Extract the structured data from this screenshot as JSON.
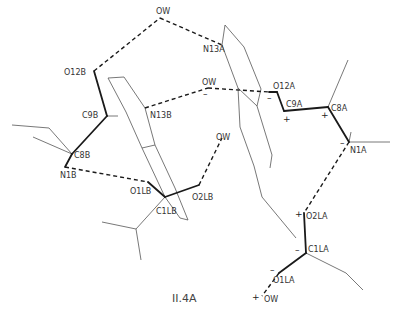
{
  "figure": {
    "caption": "II.4A",
    "colors": {
      "line": "#1a1a1a",
      "thin_line": "#555555",
      "label": "#333333",
      "background": "#ffffff"
    }
  },
  "atoms": [
    {
      "id": "OW_top",
      "label": "OW",
      "x": 160,
      "y": 18,
      "lx": 156,
      "ly": 14
    },
    {
      "id": "N13A",
      "label": "N13A",
      "x": 222,
      "y": 45,
      "lx": 203,
      "ly": 52
    },
    {
      "id": "O12B",
      "label": "O12B",
      "x": 94,
      "y": 71,
      "lx": 64,
      "ly": 75
    },
    {
      "id": "OW_mid",
      "label": "OW",
      "x": 208,
      "y": 88,
      "lx": 202,
      "ly": 85
    },
    {
      "id": "O12A",
      "label": "O12A",
      "x": 277,
      "y": 92,
      "lx": 273,
      "ly": 89
    },
    {
      "id": "C9A",
      "label": "C9A",
      "x": 284,
      "y": 111,
      "lx": 286,
      "ly": 107
    },
    {
      "id": "C8A",
      "label": "C8A",
      "x": 328,
      "y": 107,
      "lx": 331,
      "ly": 111
    },
    {
      "id": "C9B",
      "label": "C9B",
      "x": 107,
      "y": 116,
      "lx": 82,
      "ly": 118
    },
    {
      "id": "N13B",
      "label": "N13B",
      "x": 145,
      "y": 108,
      "lx": 150,
      "ly": 118
    },
    {
      "id": "N1A",
      "label": "N1A",
      "x": 349,
      "y": 142,
      "lx": 350,
      "ly": 153
    },
    {
      "id": "OW_right",
      "label": "OW",
      "x": 222,
      "y": 138,
      "lx": 216,
      "ly": 140
    },
    {
      "id": "C8B",
      "label": "C8B",
      "x": 72,
      "y": 154,
      "lx": 74,
      "ly": 158
    },
    {
      "id": "N1B",
      "label": "N1B",
      "x": 65,
      "y": 167,
      "lx": 60,
      "ly": 178
    },
    {
      "id": "O1LB",
      "label": "O1LB",
      "x": 148,
      "y": 182,
      "lx": 130,
      "ly": 194
    },
    {
      "id": "O2LB",
      "label": "O2LB",
      "x": 199,
      "y": 185,
      "lx": 192,
      "ly": 200
    },
    {
      "id": "C1LB",
      "label": "C1LB",
      "x": 165,
      "y": 197,
      "lx": 156,
      "ly": 214
    },
    {
      "id": "O2LA",
      "label": "O2LA",
      "x": 304,
      "y": 213,
      "lx": 306,
      "ly": 219
    },
    {
      "id": "C1LA",
      "label": "C1LA",
      "x": 306,
      "y": 253,
      "lx": 308,
      "ly": 252
    },
    {
      "id": "O1LA",
      "label": "O1LA",
      "x": 279,
      "y": 273,
      "lx": 273,
      "ly": 283
    },
    {
      "id": "OW_bot",
      "label": "OW",
      "x": 262,
      "y": 296,
      "lx": 264,
      "ly": 302
    }
  ],
  "charges": [
    {
      "sign": "–",
      "x": 267,
      "y": 101
    },
    {
      "sign": "+",
      "x": 283,
      "y": 122
    },
    {
      "sign": "+",
      "x": 321,
      "y": 118
    },
    {
      "sign": "–",
      "x": 340,
      "y": 146
    },
    {
      "sign": "–",
      "x": 203,
      "y": 97
    },
    {
      "sign": "+",
      "x": 295,
      "y": 217
    },
    {
      "sign": "–",
      "x": 295,
      "y": 253
    },
    {
      "sign": "–",
      "x": 270,
      "y": 273
    },
    {
      "sign": "+",
      "x": 252,
      "y": 300
    }
  ],
  "bonds_bold": [
    [
      94,
      71,
      107,
      116
    ],
    [
      107,
      116,
      72,
      154
    ],
    [
      72,
      154,
      65,
      167
    ],
    [
      284,
      111,
      328,
      107
    ],
    [
      328,
      107,
      349,
      142
    ],
    [
      284,
      111,
      277,
      92
    ],
    [
      277,
      92,
      269,
      92
    ],
    [
      148,
      182,
      165,
      197
    ],
    [
      165,
      197,
      199,
      185
    ],
    [
      304,
      213,
      306,
      253
    ],
    [
      306,
      253,
      279,
      273
    ]
  ],
  "hydrogen_bonds": [
    [
      94,
      71,
      160,
      18
    ],
    [
      160,
      18,
      222,
      45
    ],
    [
      145,
      108,
      208,
      88
    ],
    [
      208,
      88,
      269,
      92
    ],
    [
      65,
      167,
      148,
      182
    ],
    [
      199,
      185,
      222,
      138
    ],
    [
      349,
      142,
      304,
      213
    ],
    [
      279,
      273,
      262,
      296
    ]
  ],
  "thin_lines": [
    [
      107,
      116,
      118,
      116
    ],
    [
      108,
      78,
      124,
      77
    ],
    [
      108,
      78,
      126,
      112
    ],
    [
      124,
      77,
      145,
      108
    ],
    [
      145,
      108,
      155,
      145
    ],
    [
      126,
      112,
      142,
      148
    ],
    [
      142,
      148,
      155,
      145
    ],
    [
      142,
      148,
      165,
      197
    ],
    [
      155,
      145,
      175,
      188
    ],
    [
      175,
      188,
      188,
      220
    ],
    [
      165,
      197,
      180,
      218
    ],
    [
      180,
      218,
      188,
      220
    ],
    [
      165,
      197,
      136,
      229
    ],
    [
      136,
      229,
      102,
      222
    ],
    [
      136,
      229,
      141,
      260
    ],
    [
      72,
      154,
      49,
      128
    ],
    [
      49,
      128,
      12,
      125
    ],
    [
      72,
      154,
      33,
      137
    ],
    [
      72,
      154,
      65,
      167
    ],
    [
      222,
      45,
      225,
      25
    ],
    [
      225,
      25,
      244,
      47
    ],
    [
      244,
      47,
      261,
      89
    ],
    [
      222,
      45,
      238,
      88
    ],
    [
      238,
      88,
      257,
      106
    ],
    [
      261,
      89,
      257,
      106
    ],
    [
      238,
      88,
      240,
      127
    ],
    [
      257,
      106,
      272,
      155
    ],
    [
      240,
      127,
      254,
      166
    ],
    [
      272,
      155,
      270,
      168
    ],
    [
      254,
      166,
      262,
      197
    ],
    [
      262,
      197,
      296,
      238
    ],
    [
      328,
      107,
      348,
      60
    ],
    [
      349,
      142,
      390,
      142
    ],
    [
      349,
      142,
      351,
      132
    ],
    [
      306,
      253,
      346,
      273
    ],
    [
      346,
      273,
      363,
      290
    ]
  ]
}
